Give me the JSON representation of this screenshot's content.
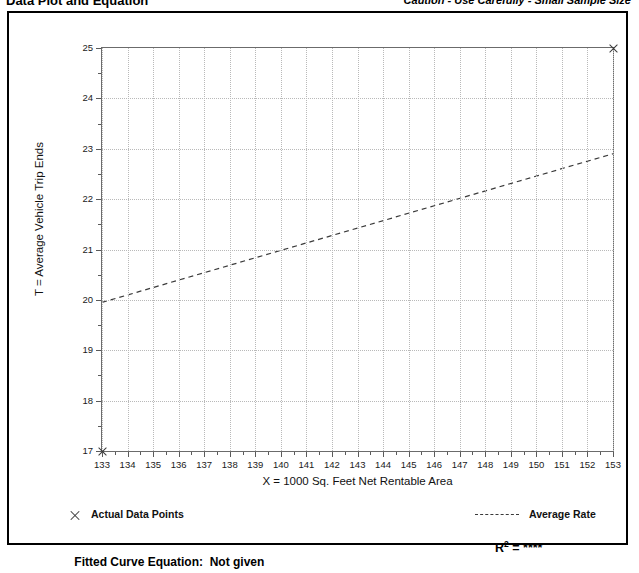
{
  "header": {
    "left_title": "Data Plot and Equation",
    "right_note": "Caution - Use Carefully - Small Sample Size"
  },
  "footer": {
    "legend_points_label": "Actual Data Points",
    "legend_points_marker": "x-cross-icon",
    "legend_rate_label": "Average Rate",
    "legend_rate_marker": "dashed-line-icon",
    "fitted_equation_label": "Fitted Curve Equation:",
    "fitted_equation_value": "Not given",
    "r2_label": "R",
    "r2_exponent": "2",
    "r2_equals": " = ",
    "r2_value": "****"
  },
  "chart_data": {
    "type": "scatter",
    "title": "Data Plot and Equation",
    "xlabel": "X = 1000 Sq. Feet Net Rentable Area",
    "ylabel": "T = Average Vehicle Trip Ends",
    "xlim": [
      133,
      153
    ],
    "ylim": [
      17,
      25
    ],
    "xticks": [
      133,
      134,
      135,
      136,
      137,
      138,
      139,
      140,
      141,
      142,
      143,
      144,
      145,
      146,
      147,
      148,
      149,
      150,
      151,
      152,
      153
    ],
    "yticks": [
      17,
      18,
      19,
      20,
      21,
      22,
      23,
      24,
      25
    ],
    "x_minor_step": 0.5,
    "y_minor_step": 0.5,
    "grid": true,
    "legend_position": "below-axes",
    "series": [
      {
        "name": "Actual Data Points",
        "type": "scatter",
        "marker": "x",
        "points": [
          {
            "x": 133,
            "y": 17
          },
          {
            "x": 153,
            "y": 25
          }
        ]
      },
      {
        "name": "Average Rate",
        "type": "line",
        "style": "dashed",
        "points": [
          {
            "x": 133,
            "y": 19.95
          },
          {
            "x": 153,
            "y": 22.9
          }
        ]
      }
    ]
  }
}
